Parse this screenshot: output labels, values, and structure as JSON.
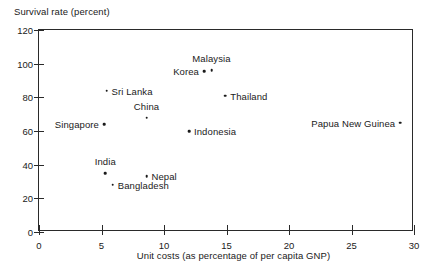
{
  "chart_data": {
    "type": "scatter",
    "title": "",
    "xlabel": "Unit costs (as percentage of per capita GNP)",
    "ylabel": "Survival rate (percent)",
    "xlim": [
      0,
      30
    ],
    "ylim": [
      0,
      120
    ],
    "xticks": [
      0,
      5,
      10,
      15,
      20,
      25,
      30
    ],
    "yticks": [
      0,
      20,
      40,
      60,
      80,
      100,
      120
    ],
    "grid": false,
    "legend": "none",
    "points": [
      {
        "label": "Singapore",
        "x": 5.2,
        "y": 64.0,
        "label_pos": "left"
      },
      {
        "label": "Sri Lanka",
        "x": 5.4,
        "y": 84.0,
        "label_pos": "right"
      },
      {
        "label": "India",
        "x": 5.3,
        "y": 35.0,
        "label_pos": "above"
      },
      {
        "label": "Bangladesh",
        "x": 5.9,
        "y": 28.0,
        "label_pos": "right"
      },
      {
        "label": "China",
        "x": 8.6,
        "y": 68.0,
        "label_pos": "above"
      },
      {
        "label": "Nepal",
        "x": 8.6,
        "y": 33.0,
        "label_pos": "right"
      },
      {
        "label": "Indonesia",
        "x": 12.0,
        "y": 60.0,
        "label_pos": "right"
      },
      {
        "label": "Korea",
        "x": 13.2,
        "y": 95.5,
        "label_pos": "left"
      },
      {
        "label": "Malaysia",
        "x": 13.8,
        "y": 96.0,
        "label_pos": "above"
      },
      {
        "label": "Thailand",
        "x": 14.9,
        "y": 81.0,
        "label_pos": "right"
      },
      {
        "label": "Papua New Guinea",
        "x": 28.9,
        "y": 65.0,
        "label_pos": "left"
      }
    ]
  },
  "axes": {
    "y_title": "Survival rate (percent)",
    "x_title": "Unit costs (as percentage of per capita GNP)",
    "y_tick_labels": [
      "0",
      "20",
      "40",
      "60",
      "80",
      "100",
      "120"
    ],
    "x_tick_labels": [
      "0",
      "5",
      "10",
      "15",
      "20",
      "25",
      "30"
    ]
  },
  "colors": {
    "axis": "#2a2a2a",
    "text": "#1a1a1a",
    "marker": "#1a1a1a",
    "background": "#ffffff"
  }
}
